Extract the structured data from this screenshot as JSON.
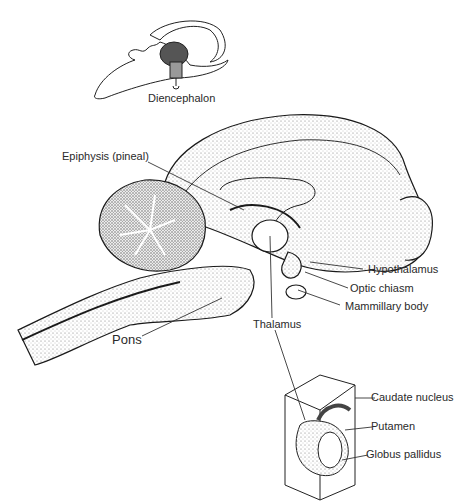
{
  "figure": {
    "inset_top": {
      "label": "Diencephalon"
    },
    "main_labels": {
      "epiphysis": "Epiphysis (pineal)",
      "hypothalamus": "Hypothalamus",
      "optic_chiasm": "Optic chiasm",
      "mammillary_body": "Mammillary body",
      "thalamus": "Thalamus",
      "pons": "Pons"
    },
    "inset_bottom": {
      "caudate": "Caudate nucleus",
      "putamen": "Putamen",
      "globus_pallidus": "Globus pallidus"
    }
  }
}
